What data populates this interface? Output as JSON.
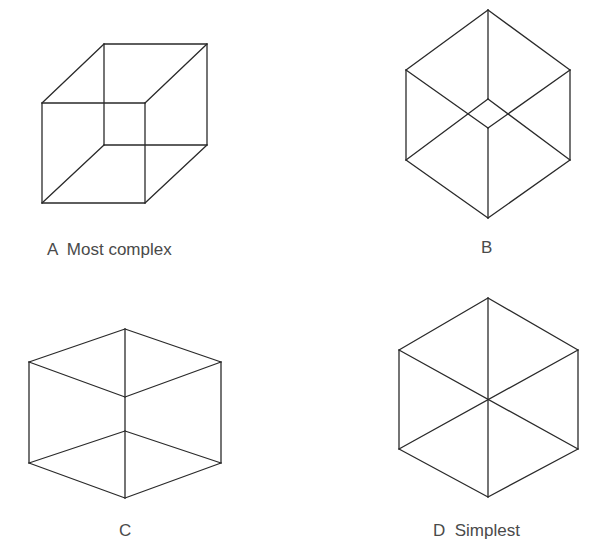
{
  "figures": [
    {
      "id": "A",
      "label": "A  Most complex",
      "description": "Necker cube, oblique projection, front and back squares offset"
    },
    {
      "id": "B",
      "label": "B",
      "description": "Cube viewed near corner-on, hexagonal outline with small inner diamond"
    },
    {
      "id": "C",
      "label": "C",
      "description": "Cube, hexagonal outline, edges meeting at two separate center points"
    },
    {
      "id": "D",
      "label": "D  Simplest",
      "description": "Cube viewed exactly corner-on, hexagon with three diagonals through center"
    }
  ],
  "style": {
    "line_color": "#2a2a2a",
    "text_color": "#4a4a4a",
    "background": "#ffffff"
  }
}
